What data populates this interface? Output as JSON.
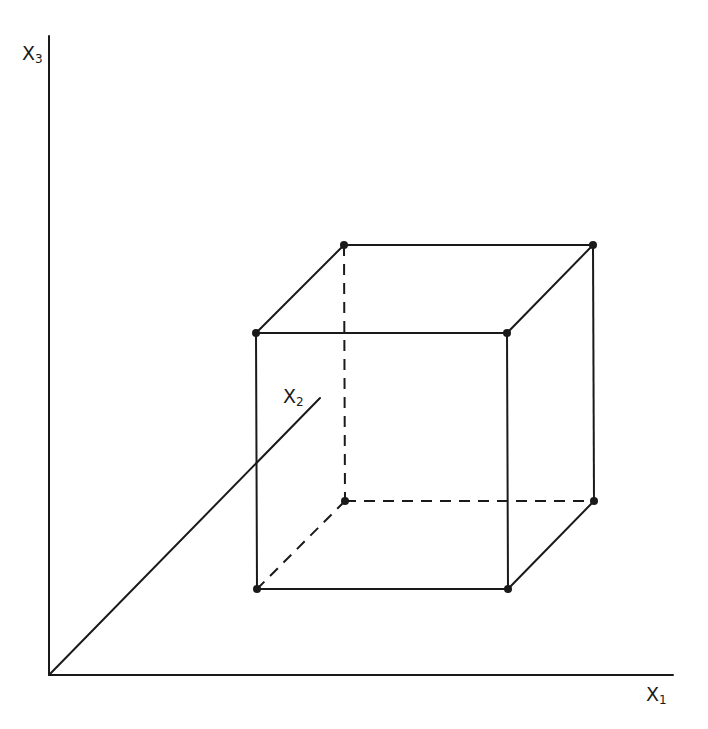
{
  "colors": {
    "ink": "#1a1a1a",
    "background": "#ffffff"
  },
  "axes": {
    "x1": {
      "label": "X",
      "subscript": "1"
    },
    "x2": {
      "label": "X",
      "subscript": "2"
    },
    "x3": {
      "label": "X",
      "subscript": "3"
    }
  },
  "geometry": {
    "origin": [
      49,
      675
    ],
    "x1_axis_end": [
      673,
      675
    ],
    "x3_axis_end": [
      49,
      36
    ],
    "x2_axis_end": [
      320,
      398
    ],
    "cube": {
      "front": {
        "tl": [
          256,
          333
        ],
        "tr": [
          507,
          333
        ],
        "br": [
          508,
          589
        ],
        "bl": [
          257,
          589
        ]
      },
      "back": {
        "tl": [
          344,
          245
        ],
        "tr": [
          593,
          245
        ],
        "br": [
          594,
          501
        ],
        "bl": [
          345,
          501
        ]
      },
      "hidden_edges": [
        "back.tl-back.bl",
        "back.bl-back.br",
        "back.bl-front.bl"
      ],
      "vertex_count": 8
    }
  }
}
